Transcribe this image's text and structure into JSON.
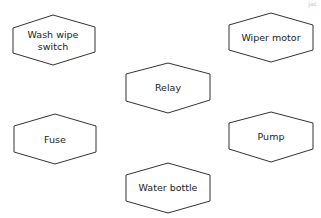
{
  "diagram": {
    "corner_text": "jac",
    "nodes": [
      {
        "id": "wash-wipe-switch",
        "label_lines": [
          "Wash wipe",
          "switch"
        ],
        "cx": 53,
        "cy": 42
      },
      {
        "id": "wiper-motor",
        "label_lines": [
          "Wiper motor"
        ],
        "cx": 271,
        "cy": 38
      },
      {
        "id": "relay",
        "label_lines": [
          "Relay"
        ],
        "cx": 168,
        "cy": 88
      },
      {
        "id": "fuse",
        "label_lines": [
          "Fuse"
        ],
        "cx": 55,
        "cy": 140
      },
      {
        "id": "pump",
        "label_lines": [
          "Pump"
        ],
        "cx": 271,
        "cy": 137
      },
      {
        "id": "water-bottle",
        "label_lines": [
          "Water bottle"
        ],
        "cx": 168,
        "cy": 188
      }
    ],
    "stroke_color": "#333333",
    "background": "#ffffff"
  }
}
